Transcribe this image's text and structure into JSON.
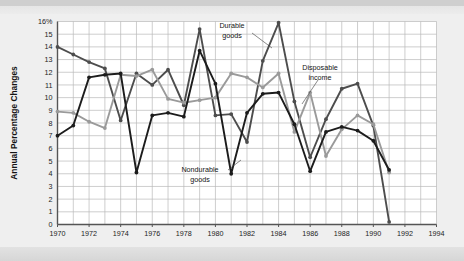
{
  "chart_data": {
    "type": "line",
    "title": "",
    "subtitle": "",
    "xlabel": "",
    "ylabel": "Annual Percentage Changes",
    "xlim": [
      1970,
      1994
    ],
    "ylim": [
      0,
      16
    ],
    "grid": true,
    "legend_position": "inline-annotations",
    "x_tick_labels": [
      "1970",
      "1972",
      "1974",
      "1976",
      "1978",
      "1980",
      "1982",
      "1984",
      "1986",
      "1988",
      "1990",
      "1992",
      "1994"
    ],
    "x_tick_values": [
      1970,
      1972,
      1974,
      1976,
      1978,
      1980,
      1982,
      1984,
      1986,
      1988,
      1990,
      1992,
      1994
    ],
    "y_tick_labels": [
      "0",
      "1",
      "2",
      "3",
      "4",
      "5",
      "6",
      "7",
      "8",
      "9",
      "10",
      "11",
      "12",
      "13",
      "14",
      "15",
      "16%"
    ],
    "y_tick_values": [
      0,
      1,
      2,
      3,
      4,
      5,
      6,
      7,
      8,
      9,
      10,
      11,
      12,
      13,
      14,
      15,
      16
    ],
    "x": [
      1970,
      1971,
      1972,
      1973,
      1974,
      1975,
      1976,
      1977,
      1978,
      1979,
      1980,
      1981,
      1982,
      1983,
      1984,
      1985,
      1986,
      1987,
      1988,
      1989,
      1990,
      1991
    ],
    "series": [
      {
        "name": "Durable goods",
        "color": "#4d4d4d",
        "values": [
          14.0,
          13.4,
          12.8,
          12.3,
          8.2,
          11.9,
          11.0,
          12.2,
          9.4,
          15.4,
          8.6,
          8.7,
          6.5,
          12.9,
          15.9,
          9.7,
          5.3,
          8.3,
          10.7,
          11.1,
          7.8,
          0.2
        ]
      },
      {
        "name": "Disposable income",
        "color": "#9a9a9a",
        "values": [
          8.9,
          8.8,
          8.1,
          7.6,
          11.8,
          11.7,
          12.2,
          9.9,
          9.6,
          9.8,
          10.0,
          11.9,
          11.6,
          10.8,
          11.9,
          7.3,
          10.4,
          5.4,
          7.5,
          8.6,
          7.9,
          4.1
        ]
      },
      {
        "name": "Nondurable goods",
        "color": "#1c1c1c",
        "values": [
          7.0,
          7.8,
          11.6,
          11.8,
          11.9,
          4.1,
          8.6,
          8.8,
          8.5,
          13.7,
          11.1,
          4.0,
          8.8,
          10.3,
          10.4,
          7.9,
          4.2,
          7.3,
          7.7,
          7.4,
          6.6,
          4.3
        ]
      }
    ],
    "annotations": [
      {
        "text_lines": [
          "Durable",
          "goods"
        ],
        "target_series": "Durable goods"
      },
      {
        "text_lines": [
          "Disposable",
          "income"
        ],
        "target_series": "Disposable income"
      },
      {
        "text_lines": [
          "Nondurable",
          "goods"
        ],
        "target_series": "Nondurable goods"
      }
    ]
  },
  "axis": {
    "y_title": "Annual Percentage Changes"
  },
  "annotations": {
    "durable": {
      "line1": "Durable",
      "line2": "goods"
    },
    "disposable": {
      "line1": "Disposable",
      "line2": "income"
    },
    "nondurable": {
      "line1": "Nondurable",
      "line2": "goods"
    }
  },
  "colors": {
    "durable": "#4d4d4d",
    "disposable": "#9a9a9a",
    "nondurable": "#1c1c1c",
    "grid": "#b9b9b9",
    "axis": "#555555",
    "plot_bg": "#ffffff",
    "page_bg": "#efefef"
  }
}
